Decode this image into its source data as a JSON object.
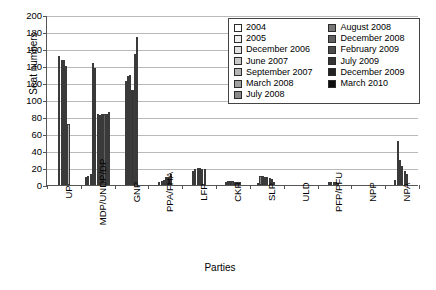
{
  "chart_data": {
    "type": "bar",
    "title": "",
    "xlabel": "Parties",
    "ylabel": "Seat numbers",
    "ylim": [
      0,
      200
    ],
    "ytick_step": 20,
    "yticks": [
      0,
      20,
      40,
      60,
      80,
      100,
      120,
      140,
      160,
      180,
      200
    ],
    "grid": true,
    "legend_position": "upper-right",
    "categories": [
      "UP",
      "MDP/UNDP/DP",
      "GNP",
      "PPA/FHA",
      "LFP",
      "CKP",
      "SLP",
      "ULD",
      "PFP/PFU",
      "NPP",
      "NPA"
    ],
    "series": [
      {
        "name": "2004",
        "color": "#ffffff",
        "values": [
          152,
          10,
          0,
          0,
          0,
          0,
          0,
          0,
          0,
          0,
          0
        ]
      },
      {
        "name": "2005",
        "color": "#efefef",
        "values": [
          147,
          11,
          0,
          0,
          0,
          0,
          0,
          0,
          0,
          0,
          0
        ]
      },
      {
        "name": "December 2006",
        "color": "#e0e0e0",
        "values": [
          147,
          13,
          0,
          0,
          0,
          0,
          0,
          0,
          0,
          0,
          0
        ]
      },
      {
        "name": "June 2007",
        "color": "#c9c9c9",
        "values": [
          140,
          144,
          0,
          0,
          0,
          0,
          0,
          0,
          0,
          0,
          0
        ]
      },
      {
        "name": "September 2007",
        "color": "#b5b5b5",
        "values": [
          72,
          138,
          0,
          0,
          0,
          0,
          0,
          0,
          0,
          0,
          0
        ]
      },
      {
        "name": "March 2008",
        "color": "#a0a0a0",
        "values": [
          0,
          84,
          0,
          0,
          0,
          0,
          2,
          0,
          0,
          0,
          0
        ]
      },
      {
        "name": "July 2008",
        "color": "#8a8a8a",
        "values": [
          0,
          82,
          0,
          0,
          0,
          4,
          11,
          0,
          0,
          0,
          0
        ]
      },
      {
        "name": "August 2008",
        "color": "#767676",
        "values": [
          0,
          83,
          122,
          4,
          16,
          5,
          11,
          0,
          0,
          0,
          6
        ]
      },
      {
        "name": "December 2008",
        "color": "#5f5f5f",
        "values": [
          0,
          83,
          128,
          5,
          19,
          5,
          10,
          0,
          4,
          0,
          52
        ]
      },
      {
        "name": "February 2009",
        "color": "#4a4a4a",
        "values": [
          0,
          84,
          129,
          6,
          20,
          5,
          9,
          0,
          4,
          0,
          30
        ]
      },
      {
        "name": "July 2009",
        "color": "#343434",
        "values": [
          0,
          86,
          112,
          9,
          20,
          4,
          8,
          0,
          4,
          0,
          22
        ]
      },
      {
        "name": "December 2009",
        "color": "#232323",
        "values": [
          0,
          0,
          154,
          10,
          19,
          4,
          7,
          0,
          3,
          0,
          17
        ]
      },
      {
        "name": "March 2010",
        "color": "#0d0d0d",
        "values": [
          0,
          0,
          174,
          13,
          19,
          4,
          4,
          0,
          2,
          0,
          13
        ]
      }
    ],
    "extra_bars": {
      "GNP": [
        122,
        123,
        126,
        128,
        131,
        112,
        154,
        174,
        173,
        170,
        171
      ],
      "note_visible_series_per_cluster": true
    }
  },
  "legend": {
    "column_1": [
      "2004",
      "2005",
      "December 2006",
      "June 2007",
      "September 2007",
      "March 2008",
      "July 2008"
    ],
    "column_2": [
      "August 2008",
      "December 2008",
      "February 2009",
      "July 2009",
      "December 2009",
      "March 2010"
    ]
  }
}
